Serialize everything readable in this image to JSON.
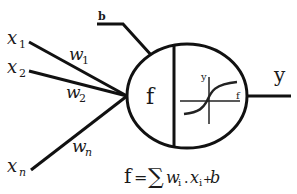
{
  "diagram": {
    "type": "perceptron-neuron",
    "inputs": [
      {
        "label": "x",
        "sub": "1",
        "weight": "w",
        "weight_sub": "1"
      },
      {
        "label": "x",
        "sub": "2",
        "weight": "w",
        "weight_sub": "2"
      },
      {
        "label": "x",
        "sub": "n",
        "weight": "w",
        "weight_sub": "n"
      }
    ],
    "bias_label": "b",
    "neuron_label": "f",
    "activation": {
      "y_axis_label": "y",
      "x_axis_label": "f",
      "shape": "sigmoid"
    },
    "output_label": "y",
    "formula": {
      "lhs": "f",
      "eq": "=",
      "sum": "∑",
      "w": "w",
      "w_sub": "i",
      "dot": ".",
      "x": "x",
      "x_sub": "i",
      "plus": "+",
      "b": "b"
    }
  }
}
